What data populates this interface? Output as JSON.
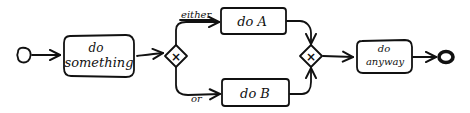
{
  "diagram": {
    "type": "bpmn-process-sketch",
    "start_event": {
      "label": ""
    },
    "tasks": [
      {
        "id": "do_something",
        "line1": "do",
        "line2": "something"
      },
      {
        "id": "do_a",
        "label": "do A"
      },
      {
        "id": "do_b",
        "label": "do B"
      },
      {
        "id": "do_anyway",
        "line1": "do",
        "line2": "anyway"
      }
    ],
    "gateways": [
      {
        "id": "split",
        "symbol": "×",
        "kind": "exclusive"
      },
      {
        "id": "join",
        "symbol": "×",
        "kind": "exclusive"
      }
    ],
    "flows": [
      {
        "from": "start",
        "to": "do_something",
        "label": ""
      },
      {
        "from": "do_something",
        "to": "split",
        "label": ""
      },
      {
        "from": "split",
        "to": "do_a",
        "label": "either"
      },
      {
        "from": "split",
        "to": "do_b",
        "label": "or"
      },
      {
        "from": "do_a",
        "to": "join",
        "label": ""
      },
      {
        "from": "do_b",
        "to": "join",
        "label": ""
      },
      {
        "from": "join",
        "to": "do_anyway",
        "label": ""
      },
      {
        "from": "do_anyway",
        "to": "end",
        "label": ""
      }
    ],
    "end_event": {
      "label": ""
    }
  }
}
